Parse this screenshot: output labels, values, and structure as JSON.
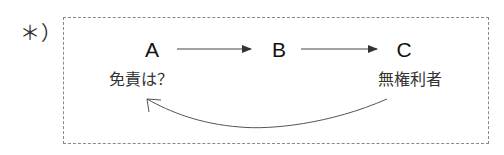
{
  "marker": "＊）",
  "nodes": [
    {
      "id": "A",
      "label": "A"
    },
    {
      "id": "B",
      "label": "B"
    },
    {
      "id": "C",
      "label": "C"
    }
  ],
  "labels": {
    "A": "免責は？",
    "C": "無権利者"
  },
  "edges": [
    {
      "from": "A",
      "to": "B",
      "type": "straight-arrow"
    },
    {
      "from": "B",
      "to": "C",
      "type": "straight-arrow"
    },
    {
      "from": "C",
      "to": "A",
      "type": "curved-arrow"
    }
  ],
  "colors": {
    "border": "#888888",
    "line": "#444444",
    "text": "#111111"
  }
}
